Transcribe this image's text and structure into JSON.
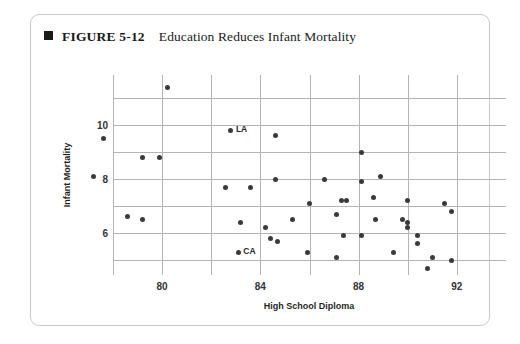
{
  "figure": {
    "bullet_icon": "filled-square-icon",
    "number_label": "FIGURE 5-12",
    "title": "Education Reduces Infant Mortality"
  },
  "chart_data": {
    "type": "scatter",
    "title": "Education Reduces Infant Mortality",
    "xlabel": "High School Diploma",
    "ylabel": "Infant Mortality",
    "xlim": [
      78,
      94
    ],
    "ylim": [
      4.45,
      11.85
    ],
    "grid": true,
    "legend": "none",
    "xticks": [
      80,
      84,
      88,
      92
    ],
    "yticks": [
      10,
      8,
      6
    ],
    "xgridlines": [
      78,
      80,
      82,
      84,
      86,
      88,
      90,
      92
    ],
    "ygridlines": [
      11,
      10,
      9,
      8,
      7,
      6,
      5
    ],
    "point_color": "#3a3a3a",
    "gridline_color": "#b4b4b4",
    "points": [
      {
        "x": 80.2,
        "y": 11.4,
        "label": ""
      },
      {
        "x": 77.6,
        "y": 9.5,
        "label": ""
      },
      {
        "x": 82.8,
        "y": 9.8,
        "label": "LA"
      },
      {
        "x": 84.6,
        "y": 9.6,
        "label": ""
      },
      {
        "x": 79.2,
        "y": 8.8,
        "label": ""
      },
      {
        "x": 79.9,
        "y": 8.8,
        "label": ""
      },
      {
        "x": 88.1,
        "y": 9.0,
        "label": ""
      },
      {
        "x": 77.2,
        "y": 8.1,
        "label": ""
      },
      {
        "x": 83.6,
        "y": 7.7,
        "label": ""
      },
      {
        "x": 84.6,
        "y": 8.0,
        "label": ""
      },
      {
        "x": 86.6,
        "y": 8.0,
        "label": ""
      },
      {
        "x": 88.1,
        "y": 7.9,
        "label": ""
      },
      {
        "x": 88.9,
        "y": 8.1,
        "label": ""
      },
      {
        "x": 82.6,
        "y": 7.7,
        "label": ""
      },
      {
        "x": 86.0,
        "y": 7.1,
        "label": ""
      },
      {
        "x": 87.3,
        "y": 7.2,
        "label": ""
      },
      {
        "x": 87.5,
        "y": 7.2,
        "label": ""
      },
      {
        "x": 88.6,
        "y": 7.3,
        "label": ""
      },
      {
        "x": 90.0,
        "y": 7.2,
        "label": ""
      },
      {
        "x": 91.5,
        "y": 7.1,
        "label": ""
      },
      {
        "x": 78.6,
        "y": 6.6,
        "label": ""
      },
      {
        "x": 79.2,
        "y": 6.5,
        "label": ""
      },
      {
        "x": 83.2,
        "y": 6.4,
        "label": ""
      },
      {
        "x": 84.2,
        "y": 6.2,
        "label": ""
      },
      {
        "x": 85.3,
        "y": 6.5,
        "label": ""
      },
      {
        "x": 87.1,
        "y": 6.7,
        "label": ""
      },
      {
        "x": 88.7,
        "y": 6.5,
        "label": ""
      },
      {
        "x": 89.8,
        "y": 6.5,
        "label": ""
      },
      {
        "x": 90.0,
        "y": 6.4,
        "label": ""
      },
      {
        "x": 90.0,
        "y": 6.2,
        "label": ""
      },
      {
        "x": 91.8,
        "y": 6.8,
        "label": ""
      },
      {
        "x": 84.4,
        "y": 5.8,
        "label": ""
      },
      {
        "x": 84.7,
        "y": 5.7,
        "label": ""
      },
      {
        "x": 87.4,
        "y": 5.9,
        "label": ""
      },
      {
        "x": 88.1,
        "y": 5.9,
        "label": ""
      },
      {
        "x": 90.4,
        "y": 5.9,
        "label": ""
      },
      {
        "x": 90.4,
        "y": 5.6,
        "label": ""
      },
      {
        "x": 83.1,
        "y": 5.3,
        "label": "CA"
      },
      {
        "x": 85.9,
        "y": 5.3,
        "label": ""
      },
      {
        "x": 87.1,
        "y": 5.1,
        "label": ""
      },
      {
        "x": 89.4,
        "y": 5.3,
        "label": ""
      },
      {
        "x": 91.0,
        "y": 5.1,
        "label": ""
      },
      {
        "x": 91.8,
        "y": 5.0,
        "label": ""
      },
      {
        "x": 90.8,
        "y": 4.7,
        "label": ""
      }
    ]
  }
}
